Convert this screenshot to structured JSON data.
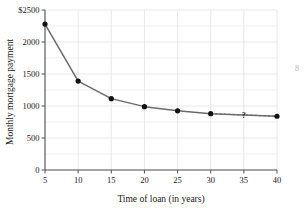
{
  "chart_data": {
    "type": "line",
    "title": "",
    "xlabel": "Time of loan (in years)",
    "ylabel": "Monthly mortgage payment",
    "x": [
      5,
      10,
      15,
      20,
      25,
      30,
      35,
      40
    ],
    "values": [
      2280,
      1390,
      1115,
      990,
      925,
      880,
      null,
      840
    ],
    "series": [
      {
        "name": "Monthly mortgage payment",
        "x": [
          5,
          10,
          15,
          20,
          25,
          30,
          40
        ],
        "values": [
          2280,
          1390,
          1115,
          990,
          925,
          880,
          840
        ],
        "style": "solid"
      },
      {
        "name": "extrapolated segment",
        "x": [
          30,
          40
        ],
        "values": [
          880,
          840
        ],
        "style": "dashed"
      }
    ],
    "unknown_point": {
      "x": 35,
      "label": "?"
    },
    "xlim": [
      5,
      40
    ],
    "ylim": [
      0,
      2500
    ],
    "xticks": [
      5,
      10,
      15,
      20,
      25,
      30,
      35,
      40
    ],
    "xtick_labels": [
      "5",
      "10",
      "15",
      "20",
      "25",
      "30",
      "35",
      "40"
    ],
    "yticks": [
      0,
      500,
      1000,
      1500,
      2000,
      2500
    ],
    "ytick_labels": [
      "0",
      "500",
      "1000",
      "1500",
      "2000",
      "$2500"
    ],
    "grid": true,
    "grid_minor_step": 250,
    "legend": "none",
    "line_color": "#6b6b6b",
    "marker_color": "#111111",
    "grid_color": "#e3e3e3",
    "axis_color": "#555555"
  },
  "axes": {
    "y_title": "Monthly mortgage payment",
    "x_title": "Time of loan (in years)"
  },
  "annotations": {
    "question_mark": "?",
    "page_number": "8"
  }
}
